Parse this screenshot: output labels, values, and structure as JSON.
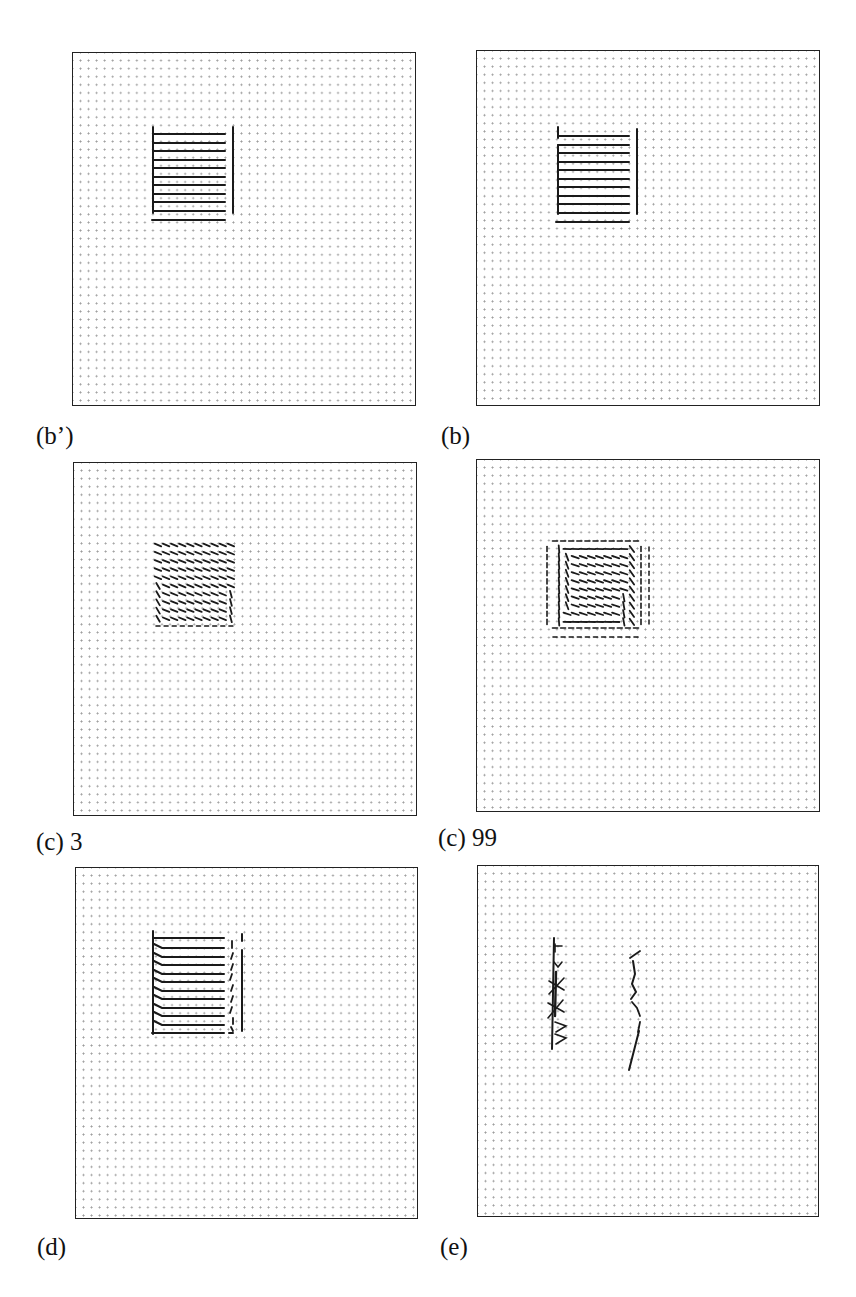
{
  "figure": {
    "panels": [
      {
        "id": "b_prime",
        "label": "(b’)",
        "description": "Ideal grid-aligned field: horizontal lines within square region with vertical boundary lines"
      },
      {
        "id": "b",
        "label": "(b)",
        "description": "Reconstructed field: horizontal lines within square region with vertical boundary lines"
      },
      {
        "id": "c3",
        "label": "(c) 3",
        "description": "Diffused field after 3 iterations: short slanted dashes in square region"
      },
      {
        "id": "c99",
        "label": "(c) 99",
        "description": "Diffused field after 99 iterations: slanted dashes forming rotated square pattern"
      },
      {
        "id": "d",
        "label": "(d)",
        "description": "Horizontal lines with hooked left ends and broken right boundary"
      },
      {
        "id": "e",
        "label": "(e)",
        "description": "Residual field: two sparse vertical strokes"
      }
    ],
    "grid": {
      "dot_spacing_px": 8,
      "columns": 42,
      "rows": 43
    }
  }
}
